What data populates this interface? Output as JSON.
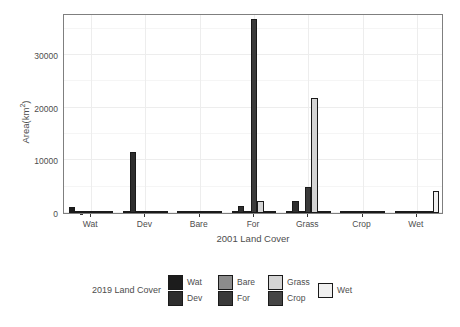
{
  "chart_data": {
    "type": "bar",
    "title": "",
    "xlabel": "2001 Land Cover",
    "ylabel": "Area(km2)",
    "ylabel_base": "Area(km",
    "ylabel_sup": "2",
    "ylabel_tail": ")",
    "legend_title": "2019 Land Cover",
    "legend_position": "bottom",
    "grid": true,
    "grouped": "dodge",
    "categories": [
      "Wat",
      "Dev",
      "Bare",
      "For",
      "Grass",
      "Crop",
      "Wet"
    ],
    "ylim": [
      0,
      38000
    ],
    "yticks": [
      0,
      10000,
      20000,
      30000
    ],
    "ytick_labels": [
      "0",
      "10000",
      "20000",
      "30000"
    ],
    "series": [
      {
        "name": "Wat",
        "color": "#1c1c1c",
        "values": [
          1150,
          60,
          30,
          40,
          35,
          25,
          120
        ]
      },
      {
        "name": "Dev",
        "color": "#2e2e2e",
        "values": [
          40,
          11500,
          60,
          1300,
          2350,
          55,
          70
        ]
      },
      {
        "name": "Bare",
        "color": "#8c8c8c",
        "values": [
          30,
          45,
          330,
          130,
          80,
          30,
          40
        ]
      },
      {
        "name": "For",
        "color": "#3a3a3a",
        "values": [
          60,
          70,
          120,
          36800,
          4900,
          60,
          110
        ]
      },
      {
        "name": "Grass",
        "color": "#d4d4d4",
        "values": [
          50,
          55,
          150,
          2350,
          21800,
          90,
          150
        ]
      },
      {
        "name": "Crop",
        "color": "#454545",
        "values": [
          35,
          40,
          60,
          210,
          260,
          420,
          90
        ]
      },
      {
        "name": "Wet",
        "color": "#f0f0f0",
        "values": [
          70,
          50,
          40,
          180,
          120,
          60,
          4200
        ]
      }
    ]
  },
  "legend": {
    "title": "2019 Land Cover",
    "columns": [
      {
        "entries": [
          {
            "label": "Wat",
            "color": "#1c1c1c"
          },
          {
            "label": "Dev",
            "color": "#2e2e2e"
          }
        ]
      },
      {
        "entries": [
          {
            "label": "Bare",
            "color": "#8c8c8c"
          },
          {
            "label": "For",
            "color": "#3a3a3a"
          }
        ]
      },
      {
        "entries": [
          {
            "label": "Grass",
            "color": "#d4d4d4"
          },
          {
            "label": "Crop",
            "color": "#454545"
          }
        ]
      },
      {
        "entries": [
          {
            "label": "Wet",
            "color": "#f0f0f0"
          }
        ]
      }
    ]
  },
  "style": {
    "panel_border": "#7f7f7f",
    "grid_major": "#ededed",
    "grid_minor": "#f5f5f5",
    "text": "#4d4d4d",
    "bar_outline": "#1a1a1a",
    "background": "#ffffff"
  }
}
